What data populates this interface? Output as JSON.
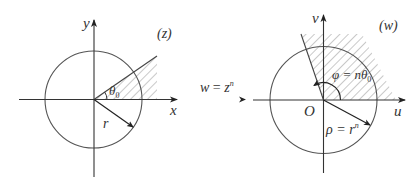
{
  "colors": {
    "stroke": "#333333",
    "circle": "#555555",
    "hatch": "#666666",
    "background": "#ffffff"
  },
  "transform_label": {
    "lhs": "w",
    "eq": " = ",
    "rhs": "z",
    "exp": "n"
  },
  "left_plane": {
    "name": "(z)",
    "x_axis_label": "x",
    "y_axis_label": "y",
    "angle_label": "θ",
    "angle_subscript": "0",
    "radius_label": "r"
  },
  "right_plane": {
    "name": "(w)",
    "u_axis_label": "u",
    "v_axis_label": "v",
    "origin_label": "O",
    "angle_label_prefix": "φ = nθ",
    "angle_subscript": "0",
    "radius_label_prefix": "ρ = r",
    "radius_exp": "n"
  }
}
